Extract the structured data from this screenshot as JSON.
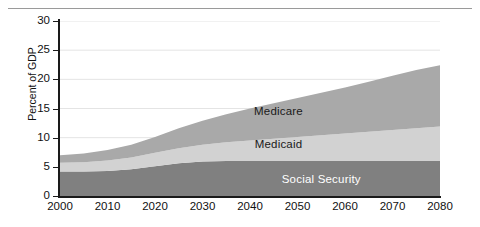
{
  "chart_data": {
    "type": "area",
    "title": "",
    "subtitle": "",
    "xlabel": "",
    "ylabel": "Percent of GDP",
    "stacked": true,
    "grid": true,
    "legend_position": "inline",
    "xlim": [
      2000,
      2080
    ],
    "ylim": [
      0,
      30
    ],
    "x_ticks": [
      2000,
      2010,
      2020,
      2030,
      2040,
      2050,
      2060,
      2070,
      2080
    ],
    "x_tick_labels": [
      "2000",
      "2010",
      "2020",
      "2030",
      "2040",
      "2050",
      "2060",
      "2070",
      "2080"
    ],
    "y_ticks": [
      0,
      5,
      10,
      15,
      20,
      25,
      30
    ],
    "y_tick_labels": [
      "0",
      "5",
      "10",
      "15",
      "20",
      "25",
      "30"
    ],
    "x": [
      2000,
      2005,
      2010,
      2015,
      2020,
      2025,
      2030,
      2035,
      2040,
      2045,
      2050,
      2055,
      2060,
      2065,
      2070,
      2075,
      2080
    ],
    "series": [
      {
        "name": "Social Security",
        "color": "#808080",
        "label_color": "#ffffff",
        "label_x": 2055,
        "label_y": 2.9,
        "values": [
          4.2,
          4.2,
          4.3,
          4.6,
          5.1,
          5.6,
          5.9,
          6.0,
          6.0,
          6.0,
          6.0,
          6.0,
          6.0,
          6.0,
          6.0,
          6.0,
          6.0
        ]
      },
      {
        "name": "Medicaid",
        "color": "#d2d2d2",
        "label_color": "#1a1a1a",
        "label_x": 2046,
        "label_y": 8.9,
        "values": [
          1.5,
          1.6,
          1.8,
          2.0,
          2.3,
          2.6,
          2.9,
          3.2,
          3.5,
          3.8,
          4.1,
          4.4,
          4.7,
          5.0,
          5.3,
          5.6,
          5.9
        ]
      },
      {
        "name": "Medicare",
        "color": "#a9a9a9",
        "label_color": "#1a1a1a",
        "label_x": 2046,
        "label_y": 14.6,
        "values": [
          1.3,
          1.5,
          1.8,
          2.2,
          2.7,
          3.4,
          4.1,
          4.8,
          5.5,
          6.1,
          6.7,
          7.3,
          7.9,
          8.6,
          9.3,
          10.0,
          10.5
        ]
      }
    ],
    "totals": [
      7.0,
      7.3,
      7.9,
      8.8,
      10.1,
      11.6,
      12.9,
      14.0,
      15.0,
      15.9,
      16.8,
      17.7,
      18.6,
      19.6,
      20.6,
      21.6,
      22.4
    ],
    "colors": {
      "social_security": "#808080",
      "medicaid": "#d2d2d2",
      "medicare": "#a9a9a9",
      "axis": "#1a1a1a",
      "gridline": "#e4e4e4",
      "top_rule": "#9a9a9a",
      "background": "#ffffff"
    }
  }
}
